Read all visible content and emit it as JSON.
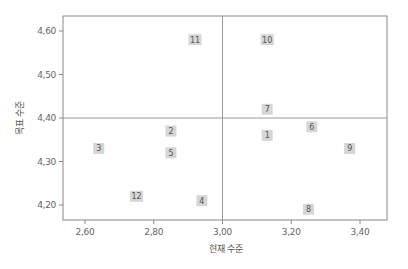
{
  "chart_data": {
    "type": "scatter",
    "title": "",
    "xlabel": "현재 수준",
    "ylabel": "목표 수준",
    "xlim": [
      2.568,
      3.48
    ],
    "ylim": [
      4.165,
      4.635
    ],
    "x_ticks": [
      2.6,
      2.8,
      3.0,
      3.2,
      3.4
    ],
    "x_tick_labels": [
      "2,60",
      "2,80",
      "3,00",
      "3,20",
      "3,40"
    ],
    "y_ticks": [
      4.2,
      4.3,
      4.4,
      4.5,
      4.6
    ],
    "y_tick_labels": [
      "4,20",
      "4,30",
      "4,40",
      "4,50",
      "4,60"
    ],
    "grid": false,
    "legend": null,
    "reference_lines": {
      "x": 3.0,
      "y": 4.4
    },
    "points": [
      {
        "label": "1",
        "x": 3.13,
        "y": 4.36
      },
      {
        "label": "2",
        "x": 2.85,
        "y": 4.37
      },
      {
        "label": "3",
        "x": 2.64,
        "y": 4.33
      },
      {
        "label": "4",
        "x": 2.94,
        "y": 4.21
      },
      {
        "label": "5",
        "x": 2.85,
        "y": 4.32
      },
      {
        "label": "6",
        "x": 3.26,
        "y": 4.38
      },
      {
        "label": "7",
        "x": 3.13,
        "y": 4.42
      },
      {
        "label": "8",
        "x": 3.25,
        "y": 4.19
      },
      {
        "label": "9",
        "x": 3.37,
        "y": 4.33
      },
      {
        "label": "10",
        "x": 3.13,
        "y": 4.58
      },
      {
        "label": "11",
        "x": 2.92,
        "y": 4.58
      },
      {
        "label": "12",
        "x": 2.75,
        "y": 4.22
      }
    ],
    "colors": {
      "marker_box": "#d6d6d6",
      "marker_text": "#555555",
      "axis": "#888888",
      "ref_line": "#999999"
    }
  }
}
